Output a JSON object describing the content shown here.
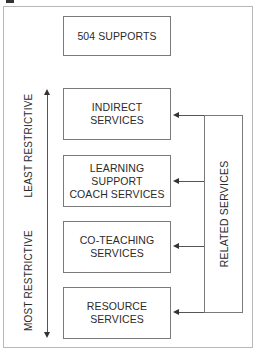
{
  "diagram": {
    "top_box": {
      "label": "504 SUPPORTS"
    },
    "services": [
      {
        "label": "INDIRECT\nSERVICES"
      },
      {
        "label": "LEARNING\nSUPPORT\nCOACH SERVICES"
      },
      {
        "label": "CO-TEACHING\nSERVICES"
      },
      {
        "label": "RESOURCE\nSERVICES"
      }
    ],
    "related_services": {
      "label": "RELATED SERVICES"
    },
    "axis": {
      "top_label": "LEAST RESTRICTIVE",
      "bottom_label": "MOST RESTRICTIVE"
    }
  },
  "colors": {
    "border": "#7a7a7a",
    "frame": "#b8b8b8",
    "text": "#2b2b2b",
    "arrow": "#333333"
  }
}
